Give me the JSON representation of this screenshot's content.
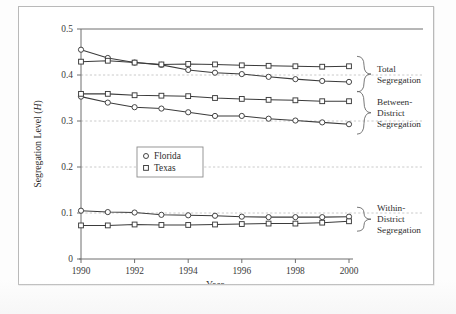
{
  "figure": {
    "y_axis_title_main": "Segregation Level (",
    "y_axis_title_symbol": "H",
    "y_axis_title_close": ")",
    "x_axis_title": "Year"
  },
  "legend": {
    "items": [
      {
        "label": "Florida",
        "marker": "circle-marker"
      },
      {
        "label": "Texas",
        "marker": "square-marker"
      }
    ]
  },
  "annotations": [
    {
      "name": "total-segregation",
      "line1": "Total",
      "line2": "Segregation",
      "line3": ""
    },
    {
      "name": "between-district-segregation",
      "line1": "Between-",
      "line2": "District",
      "line3": "Segregation"
    },
    {
      "name": "within-district-segregation",
      "line1": "Within-",
      "line2": "District",
      "line3": "Segregation"
    }
  ],
  "chart_data": {
    "type": "line",
    "title": "",
    "xlabel": "Year",
    "ylabel": "Segregation Level (H)",
    "xlim": [
      1990,
      2000
    ],
    "ylim": [
      0,
      0.5
    ],
    "yticks": [
      0,
      0.1,
      0.2,
      0.3,
      0.4,
      0.5
    ],
    "ytick_labels": [
      "0",
      "0.1",
      "0.2",
      "0.3",
      "0.4",
      "0.5"
    ],
    "xticks": [
      1990,
      1992,
      1994,
      1996,
      1998,
      2000
    ],
    "xtick_labels": [
      "1990",
      "1992",
      "1994",
      "1996",
      "1998",
      "2000"
    ],
    "x": [
      1990,
      1991,
      1992,
      1993,
      1994,
      1995,
      1996,
      1997,
      1998,
      1999,
      2000
    ],
    "grid": "horizontal-dashed",
    "legend_position": "center-left",
    "series": [
      {
        "name": "Florida",
        "group": "Total Segregation",
        "marker": "circle",
        "values": [
          0.455,
          0.437,
          0.427,
          0.422,
          0.411,
          0.405,
          0.402,
          0.396,
          0.391,
          0.387,
          0.385
        ]
      },
      {
        "name": "Texas",
        "group": "Total Segregation",
        "marker": "square",
        "values": [
          0.429,
          0.431,
          0.427,
          0.423,
          0.424,
          0.423,
          0.421,
          0.42,
          0.419,
          0.418,
          0.419
        ]
      },
      {
        "name": "Florida",
        "group": "Between-District Segregation",
        "marker": "circle",
        "values": [
          0.353,
          0.34,
          0.33,
          0.327,
          0.319,
          0.311,
          0.311,
          0.305,
          0.301,
          0.297,
          0.293
        ]
      },
      {
        "name": "Texas",
        "group": "Between-District Segregation",
        "marker": "square",
        "values": [
          0.359,
          0.359,
          0.356,
          0.355,
          0.354,
          0.35,
          0.348,
          0.346,
          0.345,
          0.343,
          0.343
        ]
      },
      {
        "name": "Florida",
        "group": "Within-District Segregation",
        "marker": "circle",
        "values": [
          0.105,
          0.102,
          0.101,
          0.096,
          0.095,
          0.094,
          0.092,
          0.091,
          0.091,
          0.091,
          0.092
        ]
      },
      {
        "name": "Texas",
        "group": "Within-District Segregation",
        "marker": "square",
        "values": [
          0.073,
          0.073,
          0.075,
          0.074,
          0.074,
          0.075,
          0.076,
          0.077,
          0.077,
          0.079,
          0.082
        ]
      }
    ]
  }
}
